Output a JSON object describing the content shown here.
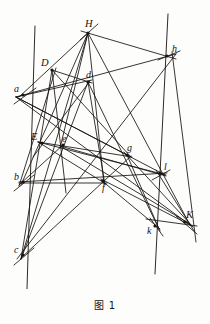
{
  "figure": {
    "caption": "图 1",
    "stroke_color": "#15120f",
    "background_color": "#fdfdfc",
    "width": 210,
    "height": 324,
    "points": [
      {
        "id": "H",
        "label": "H",
        "x": 88,
        "y": 33,
        "label_dx": -3,
        "label_dy": -14,
        "style": "cap"
      },
      {
        "id": "h",
        "label": "h",
        "x": 167,
        "y": 56,
        "label_dx": 5,
        "label_dy": -12,
        "style": "low"
      },
      {
        "id": "D",
        "label": "D",
        "x": 52,
        "y": 70,
        "label_dx": -11,
        "label_dy": -12,
        "style": "cap"
      },
      {
        "id": "d",
        "label": "d",
        "x": 88,
        "y": 82,
        "label_dx": -2,
        "label_dy": -12,
        "style": "low"
      },
      {
        "id": "a",
        "label": "a",
        "x": 23,
        "y": 95,
        "label_dx": -9,
        "label_dy": -11,
        "style": "low"
      },
      {
        "id": "E",
        "label": "E",
        "x": 42,
        "y": 143,
        "label_dx": -11,
        "label_dy": -11,
        "style": "cap"
      },
      {
        "id": "e",
        "label": "e",
        "x": 63,
        "y": 145,
        "label_dx": -1,
        "label_dy": -11,
        "style": "low"
      },
      {
        "id": "g",
        "label": "g",
        "x": 127,
        "y": 155,
        "label_dx": 0,
        "label_dy": -12,
        "style": "low"
      },
      {
        "id": "l",
        "label": "l",
        "x": 160,
        "y": 173,
        "label_dx": 4,
        "label_dy": -11,
        "style": "low"
      },
      {
        "id": "b",
        "label": "b",
        "x": 23,
        "y": 182,
        "label_dx": -9,
        "label_dy": -10,
        "style": "low"
      },
      {
        "id": "f",
        "label": "f",
        "x": 103,
        "y": 181,
        "label_dx": -1,
        "label_dy": 2,
        "style": "low"
      },
      {
        "id": "K",
        "label": "K",
        "x": 185,
        "y": 222,
        "label_dx": 1,
        "label_dy": -12,
        "style": "cap"
      },
      {
        "id": "k",
        "label": "k",
        "x": 155,
        "y": 226,
        "label_dx": -8,
        "label_dy": 0,
        "style": "low"
      },
      {
        "id": "c",
        "label": "c",
        "x": 23,
        "y": 255,
        "label_dx": -9,
        "label_dy": -10,
        "style": "low"
      }
    ],
    "vertical_lines": [
      {
        "name": "left-vertical",
        "x1": 35,
        "y1": 26,
        "x2": 27,
        "y2": 289
      },
      {
        "name": "right-vertical",
        "x1": 168,
        "y1": 14,
        "x2": 155,
        "y2": 274
      }
    ],
    "segments": [
      {
        "name": "H-c",
        "x1": 88,
        "y1": 33,
        "x2": 21,
        "y2": 259
      },
      {
        "name": "H-b",
        "x1": 88,
        "y1": 33,
        "x2": 21,
        "y2": 185
      },
      {
        "name": "H-a",
        "x1": 88,
        "y1": 33,
        "x2": 19,
        "y2": 97
      },
      {
        "name": "H-h",
        "x1": 81,
        "y1": 31,
        "x2": 176,
        "y2": 59
      },
      {
        "name": "H-K",
        "x1": 88,
        "y1": 33,
        "x2": 190,
        "y2": 225
      },
      {
        "name": "H-f",
        "x1": 88,
        "y1": 33,
        "x2": 104,
        "y2": 184
      },
      {
        "name": "H-e",
        "x1": 88,
        "y1": 33,
        "x2": 60,
        "y2": 148
      },
      {
        "name": "a-h",
        "x1": 16,
        "y1": 97,
        "x2": 176,
        "y2": 54
      },
      {
        "name": "a-d",
        "x1": 16,
        "y1": 97,
        "x2": 92,
        "y2": 80
      },
      {
        "name": "a-g",
        "x1": 16,
        "y1": 97,
        "x2": 131,
        "y2": 157
      },
      {
        "name": "a-l",
        "x1": 16,
        "y1": 97,
        "x2": 165,
        "y2": 175
      },
      {
        "name": "a-K",
        "x1": 16,
        "y1": 97,
        "x2": 190,
        "y2": 225
      },
      {
        "name": "D-d",
        "x1": 52,
        "y1": 70,
        "x2": 92,
        "y2": 83
      },
      {
        "name": "D-g",
        "x1": 52,
        "y1": 70,
        "x2": 131,
        "y2": 157
      },
      {
        "name": "D-c",
        "x1": 52,
        "y1": 70,
        "x2": 21,
        "y2": 259
      },
      {
        "name": "D-e",
        "x1": 52,
        "y1": 70,
        "x2": 66,
        "y2": 193
      },
      {
        "name": "D-b",
        "x1": 56,
        "y1": 68,
        "x2": 19,
        "y2": 186
      },
      {
        "name": "d-c",
        "x1": 88,
        "y1": 82,
        "x2": 21,
        "y2": 259
      },
      {
        "name": "d-E",
        "x1": 90,
        "y1": 81,
        "x2": 33,
        "y2": 157
      },
      {
        "name": "d-k",
        "x1": 88,
        "y1": 82,
        "x2": 159,
        "y2": 229
      },
      {
        "name": "d-f",
        "x1": 88,
        "y1": 82,
        "x2": 105,
        "y2": 185
      },
      {
        "name": "E-g",
        "x1": 38,
        "y1": 142,
        "x2": 132,
        "y2": 157
      },
      {
        "name": "E-l",
        "x1": 38,
        "y1": 142,
        "x2": 166,
        "y2": 175
      },
      {
        "name": "E-f",
        "x1": 38,
        "y1": 142,
        "x2": 106,
        "y2": 184
      },
      {
        "name": "e-b",
        "x1": 63,
        "y1": 145,
        "x2": 19,
        "y2": 185
      },
      {
        "name": "e-K",
        "x1": 60,
        "y1": 146,
        "x2": 190,
        "y2": 224
      },
      {
        "name": "e-l",
        "x1": 60,
        "y1": 146,
        "x2": 166,
        "y2": 176
      },
      {
        "name": "b-l",
        "x1": 19,
        "y1": 182,
        "x2": 167,
        "y2": 173
      },
      {
        "name": "b-f",
        "x1": 19,
        "y1": 183,
        "x2": 107,
        "y2": 183
      },
      {
        "name": "c-f-h",
        "x1": 17,
        "y1": 259,
        "x2": 176,
        "y2": 54
      },
      {
        "name": "c-g",
        "x1": 21,
        "y1": 258,
        "x2": 131,
        "y2": 156
      },
      {
        "name": "g-k",
        "x1": 127,
        "y1": 155,
        "x2": 160,
        "y2": 231
      },
      {
        "name": "g-K",
        "x1": 124,
        "y1": 152,
        "x2": 193,
        "y2": 227
      },
      {
        "name": "f-K",
        "x1": 101,
        "y1": 179,
        "x2": 192,
        "y2": 226
      },
      {
        "name": "f-k",
        "x1": 101,
        "y1": 180,
        "x2": 160,
        "y2": 229
      },
      {
        "name": "l-K",
        "x1": 156,
        "y1": 170,
        "x2": 194,
        "y2": 231
      },
      {
        "name": "h-l-K",
        "x1": 172,
        "y1": 52,
        "x2": 196,
        "y2": 242
      },
      {
        "name": "k-K-x",
        "x1": 146,
        "y1": 219,
        "x2": 197,
        "y2": 226
      },
      {
        "name": "h-tick",
        "x1": 158,
        "y1": 60,
        "x2": 180,
        "y2": 51
      },
      {
        "name": "H-tick",
        "x1": 80,
        "y1": 40,
        "x2": 98,
        "y2": 24
      },
      {
        "name": "a-tick",
        "x1": 14,
        "y1": 104,
        "x2": 36,
        "y2": 88
      },
      {
        "name": "b-tick",
        "x1": 14,
        "y1": 191,
        "x2": 34,
        "y2": 175
      },
      {
        "name": "c-tick",
        "x1": 14,
        "y1": 265,
        "x2": 34,
        "y2": 248
      },
      {
        "name": "l-tick",
        "x1": 152,
        "y1": 180,
        "x2": 170,
        "y2": 170
      },
      {
        "name": "K-tick",
        "x1": 176,
        "y1": 216,
        "x2": 197,
        "y2": 234
      },
      {
        "name": "k-tick",
        "x1": 150,
        "y1": 218,
        "x2": 163,
        "y2": 236
      }
    ]
  }
}
